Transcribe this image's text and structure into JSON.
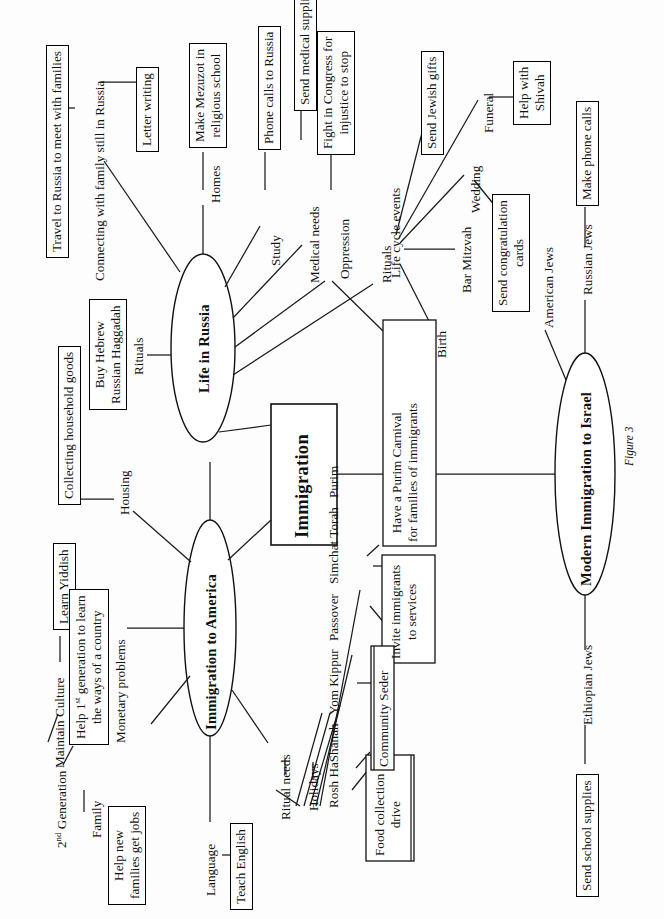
{
  "figure": {
    "caption": "Figure 3",
    "orientation": "rotated-90-ccw"
  },
  "center": {
    "label": "Immigration"
  },
  "branches": {
    "life_in_russia": {
      "label": "Life in Russia",
      "topics": [
        "Connecting with family still in Russia",
        "Homes",
        "Study",
        "Medical needs",
        "Oppression",
        "Rituals",
        "Life cycle events"
      ],
      "actions": [
        "Travel to Russia to meet with families",
        "Letter writing",
        "Make Mezuzot in religious school",
        "Phone calls to Russia",
        "Send medical supplies",
        "Fight in Congress for injustice to stop",
        "Buy Hebrew Russian Haggadah",
        "Send Jewish gifts"
      ]
    },
    "immigration_to_america": {
      "label": "Immigration to America",
      "topics": [
        "Maintain Culture",
        "2nd Generation",
        "Family",
        "Monetary problems",
        "Housing",
        "Language",
        "Ritual needs",
        "Holidays"
      ],
      "actions": [
        "Learn Yiddish",
        "Help 1st generation to learn the ways of a country",
        "Help new families get jobs",
        "Collecting household goods",
        "Teach English",
        "Food collection drive",
        "Community Seder",
        "Invite immigrants to services",
        "Have a Purim Carnival for families of immigrants"
      ],
      "holidays": [
        "Rosh HaShanah",
        "Yom Kippur",
        "Passover",
        "Simchat Torah",
        "Purim"
      ]
    },
    "modern_immigration_to_israel": {
      "label": "Modern Immigration to Israel",
      "topics": [
        "American Jews",
        "Russian Jews",
        "Ethiopian Jews"
      ],
      "actions": [
        "Make phone calls",
        "Send school supplies"
      ]
    },
    "life_cycle_events": {
      "label": "Life cycle events",
      "events": [
        "Birth",
        "Bar Mitzvah",
        "Wedding",
        "Funeral"
      ],
      "actions": [
        "Send congratulation cards",
        "Help with Shivah",
        "Send Jewish gifts"
      ]
    }
  },
  "labels": {
    "travel_to_russia": "Travel to Russia to meet with families",
    "connecting_with_family": "Connecting with family still in Russia",
    "letter_writing": "Letter writing",
    "make_mezuzot_l1": "Make Mezuzot in",
    "make_mezuzot_l2": "religious school",
    "homes": "Homes",
    "phone_calls_to_russia": "Phone calls to Russia",
    "study": "Study",
    "medical_needs": "Medical needs",
    "send_medical_supplies": "Send medical supplies",
    "oppression": "Oppression",
    "fight_congress_l1": "Fight in Congress for",
    "fight_congress_l2": "injustice to stop",
    "life_cycle_events": "Life cycle events",
    "send_jewish_gifts": "Send Jewish gifts",
    "birth": "Birth",
    "bar_mitzvah": "Bar Mitzvah",
    "wedding": "Wedding",
    "funeral": "Funeral",
    "send_congratulation_l1": "Send congratulation",
    "send_congratulation_l2": "cards",
    "help_with_shivah_l1": "Help with",
    "help_with_shivah_l2": "Shivah",
    "life_in_russia": "Life in Russia",
    "rituals": "Rituals",
    "buy_haggadah_l1": "Buy Hebrew",
    "buy_haggadah_l2": "Russian Haggadah",
    "collecting_household_goods": "Collecting household goods",
    "housing": "Housing",
    "learn_yiddish": "Learn Yiddish",
    "maintain_culture": "Maintain Culture",
    "help_first_gen_l1": "Help 1",
    "help_first_gen_sup": "st",
    "help_first_gen_l1b": " generation to learn",
    "help_first_gen_l2": "the ways of a country",
    "monetary_problems": "Monetary problems",
    "second_generation_num": "2",
    "second_generation_sup": "nd",
    "second_generation_rest": " Generation",
    "family": "Family",
    "help_new_families_l1": "Help new",
    "help_new_families_l2": "families get jobs",
    "immigration_to_america": "Immigration to America",
    "language": "Language",
    "teach_english": "Teach English",
    "ritual_needs": "Ritual needs",
    "holidays": "Holidays",
    "rosh_hashanah": "Rosh HaShanah",
    "yom_kippur": "Yom Kippur",
    "passover": "Passover",
    "simchat_torah": "Simchat Torah",
    "purim": "Purim",
    "food_collection_l1": "Food collection",
    "food_collection_l2": "drive",
    "community_seder": "Community Seder",
    "invite_immigrants_l1": "Invite immigrants",
    "invite_immigrants_l2": "to services",
    "purim_carnival_l1": "Have a Purim Carnival",
    "purim_carnival_l2": "for families of immigrants",
    "immigration": "Immigration",
    "modern_immigration_to_israel": "Modern Immigration to Israel",
    "american_jews": "American Jews",
    "russian_jews": "Russian Jews",
    "make_phone_calls": "Make phone calls",
    "ethiopian_jews": "Ethiopian Jews",
    "send_school_supplies": "Send school supplies",
    "figure_caption": "Figure 3"
  }
}
